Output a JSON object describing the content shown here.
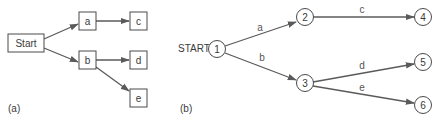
{
  "panel_a": {
    "caption": "(a)",
    "nodes": {
      "start": "Start",
      "a": "a",
      "b": "b",
      "c": "c",
      "d": "d",
      "e": "e"
    },
    "edges": [
      {
        "from": "Start",
        "to": "a"
      },
      {
        "from": "Start",
        "to": "b"
      },
      {
        "from": "a",
        "to": "c"
      },
      {
        "from": "b",
        "to": "d"
      },
      {
        "from": "b",
        "to": "e"
      }
    ]
  },
  "panel_b": {
    "caption": "(b)",
    "start_label": "START",
    "nodes": {
      "n1": "1",
      "n2": "2",
      "n3": "3",
      "n4": "4",
      "n5": "5",
      "n6": "6"
    },
    "edges": [
      {
        "from": "1",
        "to": "2",
        "label": "a"
      },
      {
        "from": "1",
        "to": "3",
        "label": "b"
      },
      {
        "from": "2",
        "to": "4",
        "label": "c"
      },
      {
        "from": "3",
        "to": "5",
        "label": "d"
      },
      {
        "from": "3",
        "to": "6",
        "label": "e"
      }
    ],
    "edge_labels": {
      "a": "a",
      "b": "b",
      "c": "c",
      "d": "d",
      "e": "e"
    }
  },
  "colors": {
    "stroke": "#4a4a4a",
    "edge": "#5a5a5a",
    "text": "#3a3a3a"
  }
}
